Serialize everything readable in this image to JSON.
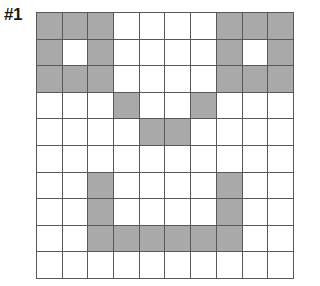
{
  "figure": {
    "label": "#1",
    "type": "pixel-grid-puzzle"
  },
  "grid": {
    "rows": 10,
    "columns": 10,
    "fill_color": "#a9a9a9",
    "empty_color": "#ffffff",
    "line_color": "#58585a",
    "legend": {
      "filled": "shaded cell",
      "empty": "blank cell"
    },
    "cells": [
      [
        1,
        1,
        1,
        0,
        0,
        0,
        0,
        1,
        1,
        1
      ],
      [
        1,
        0,
        1,
        0,
        0,
        0,
        0,
        1,
        0,
        1
      ],
      [
        1,
        1,
        1,
        0,
        0,
        0,
        0,
        1,
        1,
        1
      ],
      [
        0,
        0,
        0,
        1,
        0,
        0,
        1,
        0,
        0,
        0
      ],
      [
        0,
        0,
        0,
        0,
        1,
        1,
        0,
        0,
        0,
        0
      ],
      [
        0,
        0,
        0,
        0,
        0,
        0,
        0,
        0,
        0,
        0
      ],
      [
        0,
        0,
        1,
        0,
        0,
        0,
        0,
        1,
        0,
        0
      ],
      [
        0,
        0,
        1,
        0,
        0,
        0,
        0,
        1,
        0,
        0
      ],
      [
        0,
        0,
        1,
        1,
        1,
        1,
        1,
        1,
        0,
        0
      ],
      [
        0,
        0,
        0,
        0,
        0,
        0,
        0,
        0,
        0,
        0
      ]
    ],
    "row_counts": [
      6,
      4,
      6,
      2,
      2,
      0,
      2,
      2,
      6,
      0
    ],
    "column_counts": [
      3,
      2,
      6,
      2,
      2,
      2,
      2,
      6,
      2,
      3
    ],
    "total_filled": 30,
    "total_cells": 100
  }
}
